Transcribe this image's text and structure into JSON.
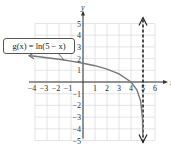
{
  "chart_data": {
    "type": "line",
    "title": "",
    "function_label": "g(x) = ln(5 − x)",
    "xlabel": "x",
    "ylabel": "y",
    "xlim": [
      -4,
      6
    ],
    "ylim": [
      -5,
      5
    ],
    "grid": true,
    "x_ticks": [
      -4,
      -3,
      -2,
      -1,
      1,
      2,
      3,
      4,
      5,
      6
    ],
    "y_ticks": [
      -5,
      -4,
      -3,
      -2,
      -1,
      1,
      2,
      3,
      4,
      5
    ],
    "x_tick_labels": [
      "−4",
      "−3",
      "−2",
      "−1",
      "1",
      "2",
      "3",
      "4",
      "5",
      "6"
    ],
    "y_tick_labels": [
      "−5",
      "−4",
      "−3",
      "−2",
      "−1",
      "1",
      "2",
      "3",
      "4",
      "5"
    ],
    "series": [
      {
        "name": "g(x) = ln(5 − x)",
        "x": [
          -4.5,
          -4,
          -3,
          -2,
          -1,
          0,
          1,
          2,
          3,
          4,
          4.5,
          4.8,
          4.95,
          4.99
        ],
        "values": [
          2.25,
          2.2,
          2.08,
          1.95,
          1.79,
          1.61,
          1.39,
          1.1,
          0.69,
          0,
          -0.69,
          -1.61,
          -3.0,
          -4.6
        ]
      }
    ],
    "asymptote": {
      "type": "vertical",
      "x": 5,
      "style": "dashed"
    },
    "annotations": [
      "g(x) = ln(5 − x)"
    ]
  },
  "labels": {
    "callout": "g(x) = ln(5 − x)",
    "x_axis": "x",
    "y_axis": "y"
  }
}
